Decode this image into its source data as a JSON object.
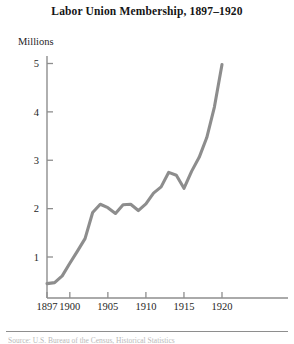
{
  "figure": {
    "title": "Labor Union Membership, 1897–1920",
    "y_unit_label": "Millions",
    "source_note": "Source: U.S. Bureau of the Census, Historical Statistics",
    "line_color": "#8d8d8d",
    "axis_color": "#8e8e8e",
    "text_color": "#262626"
  },
  "chart_data": {
    "type": "line",
    "title": "Labor Union Membership, 1897–1920",
    "subtitle": "",
    "xlabel": "",
    "ylabel": "Millions",
    "xlim": [
      1897,
      1921
    ],
    "ylim": [
      0,
      5.35
    ],
    "grid": false,
    "legend": null,
    "x_tick_labels": [
      "1897",
      "1900",
      "1905",
      "1910",
      "1915",
      "1920"
    ],
    "x_tick_values": [
      1897,
      1900,
      1905,
      1910,
      1915,
      1920
    ],
    "y_tick_labels": [
      "1",
      "2",
      "3",
      "4",
      "5"
    ],
    "y_tick_values": [
      1,
      2,
      3,
      4,
      5
    ],
    "series": [
      {
        "name": "Union membership",
        "units": "millions",
        "x": [
          1897,
          1898,
          1899,
          1900,
          1901,
          1902,
          1903,
          1904,
          1905,
          1906,
          1907,
          1908,
          1909,
          1910,
          1911,
          1912,
          1913,
          1914,
          1915,
          1916,
          1917,
          1918,
          1919,
          1920
        ],
        "values": [
          0.45,
          0.47,
          0.61,
          0.87,
          1.12,
          1.38,
          1.92,
          2.09,
          2.02,
          1.9,
          2.08,
          2.09,
          1.96,
          2.1,
          2.32,
          2.45,
          2.75,
          2.69,
          2.42,
          2.77,
          3.06,
          3.47,
          4.1,
          4.98
        ]
      }
    ],
    "annotations": []
  }
}
